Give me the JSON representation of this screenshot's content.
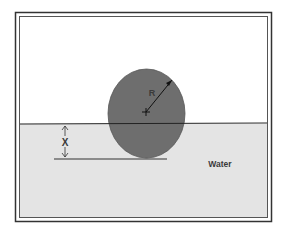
{
  "diagram": {
    "labels": {
      "radius": "R",
      "depth": "X",
      "fluid": "Water"
    },
    "colors": {
      "background": "#ffffff",
      "frame": "#333333",
      "water": "#e4e4e4",
      "sphere": "#6e6e6e",
      "line": "#2a2a2a"
    }
  }
}
